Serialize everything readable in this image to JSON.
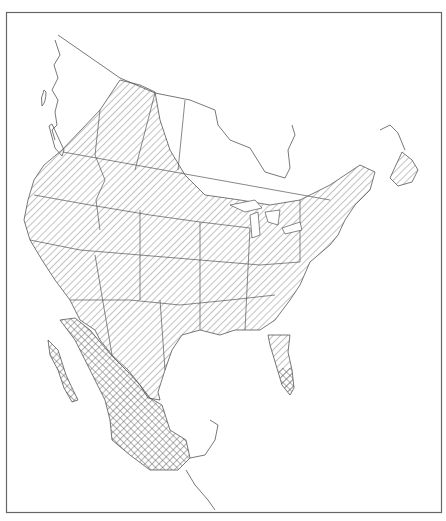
{
  "map": {
    "title": "",
    "region": "North America",
    "frame": {
      "x": 6,
      "y": 12,
      "width": 436,
      "height": 501
    },
    "colors": {
      "background": "#ffffff",
      "line": "#555555",
      "frame": "#666666",
      "hatch": "#777777"
    },
    "legend": [],
    "layers": [
      {
        "name": "range-diagonal-hatch",
        "pattern": "diagonal",
        "description": "Canada south of boreal zone, contiguous United States, northern Mexico"
      },
      {
        "name": "range-crosshatch",
        "pattern": "crosshatch",
        "description": "Baja California, western and southern Mexico, southern Florida"
      }
    ]
  }
}
